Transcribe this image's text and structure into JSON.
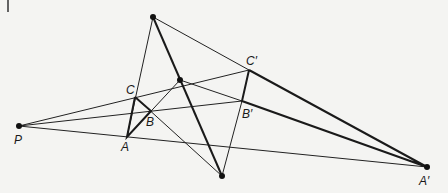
{
  "figure": {
    "type": "desargues-theorem-diagram",
    "corner_mark": "|",
    "points": {
      "P": {
        "label": "P",
        "x": 19,
        "y": 126,
        "lx": 14,
        "ly": 144
      },
      "A": {
        "label": "A",
        "x": 127,
        "y": 137,
        "lx": 121,
        "ly": 151
      },
      "B": {
        "label": "B",
        "x": 151,
        "y": 111,
        "lx": 146,
        "ly": 126
      },
      "C": {
        "label": "C",
        "x": 135,
        "y": 97,
        "lx": 126,
        "ly": 94
      },
      "A_prime": {
        "label": "A′",
        "x": 427,
        "y": 167,
        "lx": 419,
        "ly": 185
      },
      "B_prime": {
        "label": "B′",
        "x": 242,
        "y": 101,
        "lx": 242,
        "ly": 118
      },
      "C_prime": {
        "label": "C′",
        "x": 249,
        "y": 70,
        "lx": 246,
        "ly": 65
      },
      "X": {
        "label": "",
        "x": 153,
        "y": 17
      },
      "Y": {
        "label": "",
        "x": 180,
        "y": 80
      },
      "Z": {
        "label": "",
        "x": 222,
        "y": 176
      }
    }
  }
}
